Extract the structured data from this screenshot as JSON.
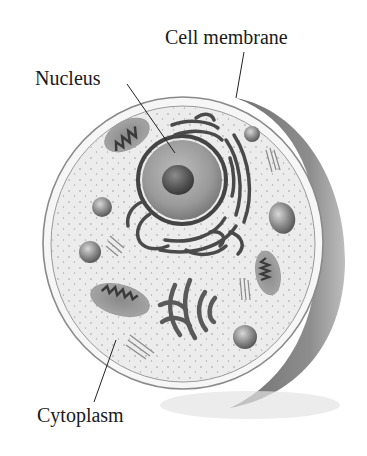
{
  "diagram": {
    "labels": {
      "cell_membrane": "Cell membrane",
      "nucleus": "Nucleus",
      "cytoplasm": "Cytoplasm"
    },
    "colors": {
      "background": "#ffffff",
      "cytoplasm_fill": "#ededed",
      "membrane_stroke": "#8a8a8a",
      "shadow_side": "#8c8c8c",
      "organelle_dark": "#4a4a4a",
      "nucleus_fill": "#9a9a9a",
      "nucleolus_fill": "#555555",
      "label_text": "#1a1a1a"
    },
    "structures": [
      "cell membrane",
      "cytoplasm",
      "nucleus",
      "nucleolus",
      "endoplasmic reticulum",
      "mitochondria",
      "golgi apparatus",
      "vesicles",
      "centrioles"
    ]
  }
}
